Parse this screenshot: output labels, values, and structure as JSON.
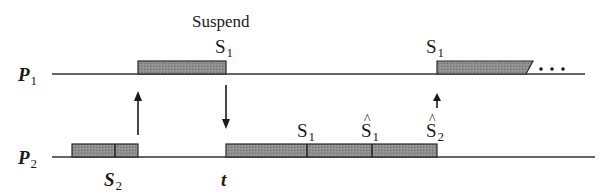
{
  "diagram": {
    "title_label": "Suspend",
    "colors": {
      "line": "#333333",
      "block_fill": "#8a8a8a",
      "block_stroke": "#2a2a2a",
      "text": "#1a1a1a",
      "background": "#ffffff"
    },
    "processes": [
      {
        "name": "P",
        "subscript": "1",
        "timeline": {
          "y": 74,
          "x_start": 52,
          "x_end": 585
        },
        "blocks": [
          {
            "x_start": 138,
            "x_end": 226,
            "dividers": []
          },
          {
            "x_start": 437,
            "x_end": 533,
            "dividers": [],
            "continues": true
          }
        ],
        "continuation": "..."
      },
      {
        "name": "P",
        "subscript": "2",
        "timeline": {
          "y": 157,
          "x_start": 52,
          "x_end": 595
        },
        "blocks": [
          {
            "x_start": 72,
            "x_end": 138,
            "dividers": [
              115
            ]
          },
          {
            "x_start": 226,
            "x_end": 437,
            "dividers": [
              307,
              372
            ]
          }
        ]
      }
    ],
    "signal_labels": [
      {
        "id": "s1-suspend",
        "base": "S",
        "subscript": "1",
        "hat": false,
        "x": 215,
        "y": 53
      },
      {
        "id": "s1-resume-p1",
        "base": "S",
        "subscript": "1",
        "hat": false,
        "x": 426,
        "y": 53
      },
      {
        "id": "s1-p2",
        "base": "S",
        "subscript": "1",
        "hat": false,
        "x": 297,
        "y": 137
      },
      {
        "id": "s1-hat-p2",
        "base": "S",
        "subscript": "1",
        "hat": true,
        "x": 361,
        "y": 137
      },
      {
        "id": "s2-hat-p2",
        "base": "S",
        "subscript": "2",
        "hat": true,
        "x": 426,
        "y": 137
      },
      {
        "id": "s2-p2",
        "base": "S",
        "subscript": "2",
        "hat": false,
        "x": 104,
        "y": 186
      }
    ],
    "time_label": {
      "text": "t",
      "x": 221,
      "y": 186
    },
    "arrows": [
      {
        "id": "p2-to-p1-up",
        "direction": "up",
        "x": 138,
        "y_from": 135,
        "y_to": 91
      },
      {
        "id": "p1-to-p2-down",
        "direction": "down",
        "x": 226,
        "y_from": 85,
        "y_to": 129
      },
      {
        "id": "resume-p1-up",
        "direction": "up",
        "x": 437,
        "y_from": 108,
        "y_to": 93
      }
    ]
  }
}
